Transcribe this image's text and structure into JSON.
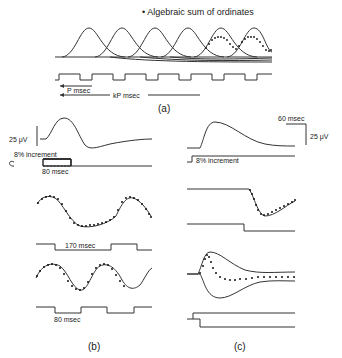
{
  "panel_a": {
    "legend": "• Algebraic sum of ordinates",
    "label_p": "P msec",
    "label_kp": "kP msec",
    "caption": "(a)"
  },
  "panel_b": {
    "scale_voltage": "25 μV",
    "increment_label": "8% increment",
    "duration_1": "80 msec",
    "duration_2": "170 msec",
    "duration_3": "80 msec",
    "caption": "(b)"
  },
  "panel_c": {
    "scale_time": "60 msec",
    "scale_voltage": "25 μV",
    "increment_label": "8% increment",
    "caption": "(c)"
  },
  "colors": {
    "ink": "#333333",
    "background": "#ffffff"
  }
}
